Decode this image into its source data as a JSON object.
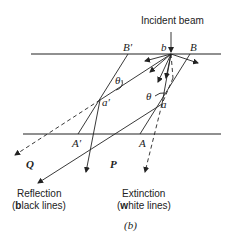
{
  "diagram": {
    "incident_label": "Incident beam",
    "labels": {
      "B_prime": "B′",
      "b": "b",
      "B": "B",
      "theta_left": "θ",
      "theta_right": "θ",
      "a_prime": "a′",
      "a": "a",
      "A_prime": "A′",
      "A": "A",
      "Q": "Q",
      "P": "P"
    },
    "legend": {
      "reflection_line1": "Reflection",
      "reflection_line2_open": "(",
      "reflection_line2_bold": "b",
      "reflection_line2_rest": "lack lines)",
      "extinction_line1": "Extinction",
      "extinction_line2_open": "(",
      "extinction_line2_bold": "w",
      "extinction_line2_rest": "hite lines)"
    },
    "caption": "(b)"
  }
}
